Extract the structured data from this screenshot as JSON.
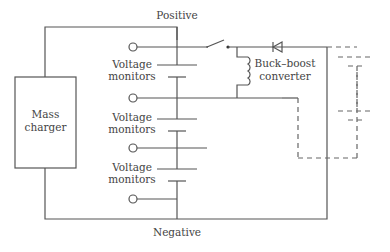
{
  "diagram": {
    "labels": {
      "positive": "Positive",
      "negative": "Negative",
      "charger_line1": "Mass",
      "charger_line2": "charger",
      "converter_line1": "Buck–boost",
      "converter_line2": "converter"
    },
    "voltage_monitors": [
      {
        "line1": "Voltage",
        "line2": "monitors"
      },
      {
        "line1": "Voltage",
        "line2": "monitors"
      },
      {
        "line1": "Voltage",
        "line2": "monitors"
      }
    ],
    "components": [
      "mass-charger",
      "battery-cell-stack",
      "switch",
      "inductor",
      "diode",
      "buck-boost-converter",
      "dashed-extension-cells"
    ],
    "colors": {
      "line": "#555555",
      "text": "#444444",
      "background": "#ffffff"
    }
  }
}
